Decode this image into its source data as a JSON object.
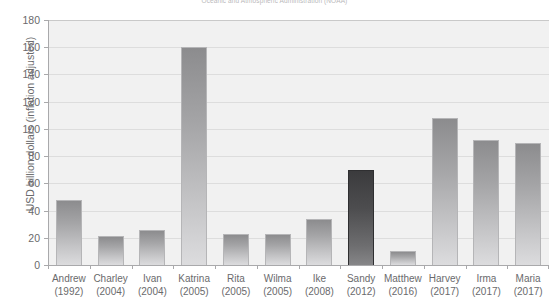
{
  "source_note": "Oceanic and Atmospheric Administration (NOAA)",
  "chart_data": {
    "type": "bar",
    "title": "",
    "subtitle": "Oceanic and Atmospheric Administration (NOAA)",
    "xlabel": "",
    "ylabel": "USD billion dollars (inflation adjusted)",
    "ylim": [
      0,
      180
    ],
    "yticks": [
      0,
      20,
      40,
      60,
      80,
      100,
      120,
      140,
      160,
      180
    ],
    "grid": true,
    "legend": "none",
    "categories": [
      "Andrew\n(1992)",
      "Charley\n(2004)",
      "Ivan\n(2004)",
      "Katrina\n(2005)",
      "Rita\n(2005)",
      "Wilma\n(2005)",
      "Ike\n(2008)",
      "Sandy\n(2012)",
      "Matthew\n(2016)",
      "Harvey\n(2017)",
      "Irma\n(2017)",
      "Maria\n(2017)"
    ],
    "names": [
      "Andrew",
      "Charley",
      "Ivan",
      "Katrina",
      "Rita",
      "Wilma",
      "Ike",
      "Sandy",
      "Matthew",
      "Harvey",
      "Irma",
      "Maria"
    ],
    "years": [
      "(1992)",
      "(2004)",
      "(2004)",
      "(2005)",
      "(2005)",
      "(2005)",
      "(2008)",
      "(2012)",
      "(2016)",
      "(2017)",
      "(2017)",
      "(2017)"
    ],
    "values": [
      48,
      21,
      26,
      160,
      23,
      23,
      34,
      70,
      10,
      108,
      92,
      90
    ],
    "highlight_index": 7,
    "colors": {
      "bar_top": "#8c8c8e",
      "bar_bottom": "#dcdcde",
      "bar_border": "#b5b5b7",
      "highlight_top": "#3b3b3d",
      "highlight_bottom": "#868688",
      "plot_background": "#f1f1f1",
      "gridline": "#dddddd",
      "axis": "#a9a9ab",
      "text": "#6a6a6c"
    }
  }
}
